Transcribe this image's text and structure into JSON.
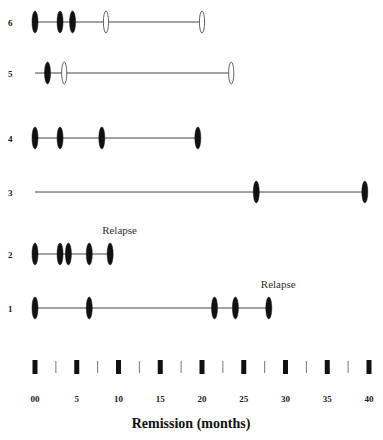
{
  "chart_data": {
    "type": "timeline",
    "title": "",
    "xlabel": "Remission (months)",
    "ylabel": "",
    "xlim": [
      0,
      40
    ],
    "x_ticks": [
      "00",
      "5",
      "10",
      "15",
      "20",
      "25",
      "30",
      "35",
      "40"
    ],
    "x_tick_values": [
      0,
      5,
      10,
      15,
      20,
      25,
      30,
      35,
      40
    ],
    "grid": false,
    "legend": null,
    "marker_types": {
      "filled": "filled black ellipse",
      "open": "open (hollow) ellipse"
    },
    "series": [
      {
        "name": "6",
        "line": [
          0,
          20
        ],
        "events": [
          {
            "x": 0,
            "type": "filled"
          },
          {
            "x": 3,
            "type": "filled"
          },
          {
            "x": 4.5,
            "type": "filled"
          },
          {
            "x": 8.5,
            "type": "open"
          },
          {
            "x": 20,
            "type": "open"
          }
        ],
        "annotation": ""
      },
      {
        "name": "5",
        "line": [
          0,
          23.5
        ],
        "events": [
          {
            "x": 1.5,
            "type": "filled"
          },
          {
            "x": 3.5,
            "type": "open"
          },
          {
            "x": 23.5,
            "type": "open"
          }
        ],
        "annotation": ""
      },
      {
        "name": "4",
        "line": [
          0,
          19.5
        ],
        "events": [
          {
            "x": 0,
            "type": "filled"
          },
          {
            "x": 3,
            "type": "filled"
          },
          {
            "x": 8,
            "type": "filled"
          },
          {
            "x": 19.5,
            "type": "filled"
          }
        ],
        "annotation": ""
      },
      {
        "name": "3",
        "line": [
          0,
          39.5
        ],
        "events": [
          {
            "x": 26.5,
            "type": "filled"
          },
          {
            "x": 39.5,
            "type": "filled"
          }
        ],
        "annotation": ""
      },
      {
        "name": "2",
        "line": [
          0,
          9
        ],
        "events": [
          {
            "x": 0,
            "type": "filled"
          },
          {
            "x": 3,
            "type": "filled"
          },
          {
            "x": 4,
            "type": "filled"
          },
          {
            "x": 6.5,
            "type": "filled"
          },
          {
            "x": 9,
            "type": "filled"
          }
        ],
        "annotation": "Relapse"
      },
      {
        "name": "1",
        "line": [
          0,
          28
        ],
        "events": [
          {
            "x": 0,
            "type": "filled"
          },
          {
            "x": 6.5,
            "type": "filled"
          },
          {
            "x": 21.5,
            "type": "filled"
          },
          {
            "x": 24,
            "type": "filled"
          },
          {
            "x": 28,
            "type": "filled"
          }
        ],
        "annotation": "Relapse"
      }
    ]
  },
  "layout": {
    "x0_px": 35,
    "px_per_month": 8.35,
    "row_y": {
      "6": 22,
      "5": 73,
      "4": 138,
      "3": 192,
      "2": 254,
      "1": 308
    },
    "label_x": 8,
    "axis_bar_y": 360,
    "tick_label_y": 402,
    "xlabel_y": 428
  }
}
